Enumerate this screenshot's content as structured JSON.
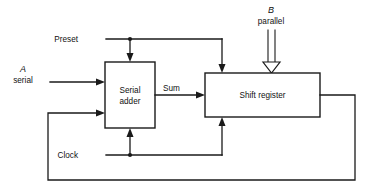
{
  "diagram": {
    "type": "block-diagram",
    "background_color": "#ffffff",
    "line_color": "#1a1a1a",
    "blocks": [
      {
        "id": "serial-adder",
        "label_line1": "Serial",
        "label_line2": "adder",
        "x": 105,
        "y": 62,
        "width": 50,
        "height": 66
      },
      {
        "id": "shift-register",
        "label": "Shift  register",
        "x": 205,
        "y": 73,
        "width": 115,
        "height": 44
      }
    ],
    "inputs": [
      {
        "id": "a-serial",
        "symbol": "A",
        "qualifier": "serial",
        "arrow_style": "solid",
        "direction": "right",
        "target": "serial-adder"
      },
      {
        "id": "b-parallel",
        "symbol": "B",
        "qualifier": "parallel",
        "arrow_style": "hollow",
        "direction": "down",
        "target": "shift-register"
      }
    ],
    "control_signals": [
      {
        "id": "preset",
        "label": "Preset",
        "targets": [
          "serial-adder",
          "shift-register"
        ],
        "junction_x": 130,
        "bus_y": 39
      },
      {
        "id": "clock",
        "label": "Clock",
        "targets": [
          "serial-adder",
          "shift-register"
        ],
        "junction_x": 130,
        "bus_y": 155
      }
    ],
    "connections": [
      {
        "id": "sum-wire",
        "label": "Sum",
        "from": "serial-adder",
        "to": "shift-register"
      },
      {
        "id": "feedback-wire",
        "label": "",
        "from": "shift-register",
        "to": "serial-adder"
      }
    ]
  }
}
